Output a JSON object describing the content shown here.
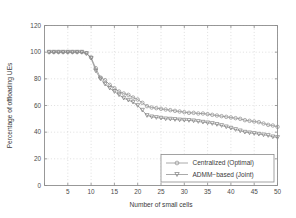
{
  "chart_data": {
    "type": "line",
    "title": "",
    "xlabel": "Number of small cells",
    "ylabel": "Percentage of offloading UEs",
    "xlim": [
      0,
      50
    ],
    "ylim": [
      0,
      120
    ],
    "xticks": [
      0,
      5,
      10,
      15,
      20,
      25,
      30,
      35,
      40,
      45,
      50
    ],
    "yticks": [
      0,
      20,
      40,
      60,
      80,
      100,
      120
    ],
    "xtick_labels": [
      "0",
      "5",
      "10",
      "15",
      "20",
      "25",
      "30",
      "35",
      "40",
      "45",
      "50"
    ],
    "ytick_labels": [
      "0",
      "20",
      "40",
      "60",
      "80",
      "100",
      "120"
    ],
    "grid": true,
    "legend_position": "lower right",
    "x": [
      1,
      2,
      3,
      4,
      5,
      6,
      7,
      8,
      9,
      10,
      11,
      12,
      13,
      14,
      15,
      16,
      17,
      18,
      19,
      20,
      21,
      22,
      23,
      24,
      25,
      26,
      27,
      28,
      29,
      30,
      31,
      32,
      33,
      34,
      35,
      36,
      37,
      38,
      39,
      40,
      41,
      42,
      43,
      44,
      45,
      46,
      47,
      48,
      49,
      50
    ],
    "series": [
      {
        "name": "Centralized (Optimal)",
        "marker": "circle",
        "color": "#8d8d8d",
        "values": [
          100,
          100,
          100,
          100,
          100,
          100,
          100,
          100,
          99.2,
          96.0,
          88.0,
          81.0,
          79.0,
          75.5,
          73.0,
          70.5,
          69.0,
          68.0,
          66.0,
          64.5,
          62.0,
          59.5,
          58.5,
          58.0,
          57.5,
          57.0,
          56.5,
          56.0,
          55.5,
          55.0,
          54.5,
          54.5,
          54.0,
          54.0,
          53.5,
          53.0,
          52.5,
          52.0,
          51.5,
          51.0,
          50.5,
          50.0,
          49.0,
          48.5,
          48.0,
          47.5,
          46.5,
          45.5,
          45.0,
          44.0
        ]
      },
      {
        "name": "ADMM−based (Joint)",
        "marker": "triangle-down",
        "color": "#7d7d7d",
        "values": [
          100,
          100,
          100,
          100,
          100,
          100,
          100,
          100,
          99.0,
          95.5,
          86.0,
          80.0,
          76.0,
          73.0,
          70.5,
          68.0,
          65.5,
          64.0,
          62.5,
          60.0,
          56.5,
          52.5,
          51.5,
          51.0,
          50.5,
          50.0,
          49.8,
          49.5,
          49.2,
          49.0,
          48.8,
          48.5,
          48.0,
          47.5,
          47.0,
          46.5,
          45.8,
          45.0,
          44.0,
          43.0,
          42.0,
          41.0,
          40.0,
          39.5,
          39.0,
          38.5,
          38.0,
          37.5,
          36.5,
          36.0
        ]
      }
    ]
  },
  "legend": {
    "entries": [
      {
        "label": "Centralized (Optimal)",
        "marker": "circle-marker"
      },
      {
        "label": "ADMM−based (Joint)",
        "marker": "triangle-down-marker"
      }
    ]
  }
}
